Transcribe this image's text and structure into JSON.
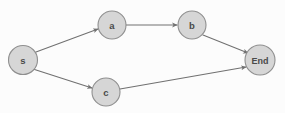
{
  "diagram": {
    "type": "directed-graph",
    "canvas": {
      "width": 285,
      "height": 113
    },
    "style": {
      "background_color": "#fcfcfc",
      "node_fill": "#d6d6d6",
      "node_stroke": "#8f8f8f",
      "node_text_color": "#4a4a4a",
      "edge_color": "#707070",
      "arrow_color": "#707070"
    },
    "nodes": [
      {
        "id": "s",
        "label": "s",
        "cx": 23,
        "cy": 60,
        "r": 14.5,
        "font_size": 9.5
      },
      {
        "id": "a",
        "label": "a",
        "cx": 112,
        "cy": 25,
        "r": 14.0,
        "font_size": 9.5
      },
      {
        "id": "b",
        "label": "b",
        "cx": 192,
        "cy": 25,
        "r": 14.0,
        "font_size": 9.5
      },
      {
        "id": "c",
        "label": "c",
        "cx": 106,
        "cy": 92,
        "r": 14.0,
        "font_size": 9.5
      },
      {
        "id": "end",
        "label": "End",
        "cx": 260,
        "cy": 60,
        "r": 15.0,
        "font_size": 9.0
      }
    ],
    "edges": [
      {
        "id": "s-a",
        "from": "s",
        "to": "a",
        "label": "",
        "x1": 36,
        "y1": 52,
        "x2": 98,
        "y2": 29
      },
      {
        "id": "s-c",
        "from": "s",
        "to": "c",
        "label": "",
        "x1": 33,
        "y1": 69,
        "x2": 92,
        "y2": 88
      },
      {
        "id": "a-b",
        "from": "a",
        "to": "b",
        "label": "",
        "x1": 126,
        "y1": 25,
        "x2": 177,
        "y2": 25
      },
      {
        "id": "b-end",
        "from": "b",
        "to": "end",
        "label": "",
        "x1": 203,
        "y1": 35,
        "x2": 248,
        "y2": 53
      },
      {
        "id": "c-end",
        "from": "c",
        "to": "end",
        "label": "",
        "x1": 120,
        "y1": 89,
        "x2": 246,
        "y2": 67
      }
    ]
  }
}
